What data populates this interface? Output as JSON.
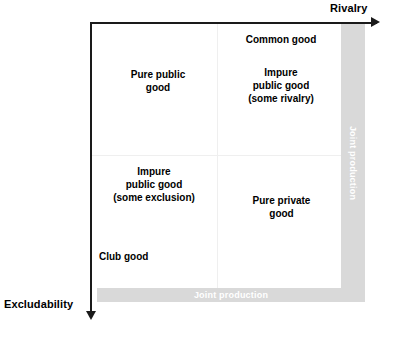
{
  "diagram": {
    "axes": {
      "horizontal": {
        "label": "Rivalry",
        "direction": "right"
      },
      "vertical": {
        "label": "Excludability",
        "direction": "down"
      }
    },
    "bands": {
      "right": {
        "label": "Joint production",
        "orientation": "vertical",
        "color": "#d9d9d9",
        "text_color": "#ffffff"
      },
      "bottom": {
        "label": "Joint production",
        "orientation": "horizontal",
        "color": "#d9d9d9",
        "text_color": "#ffffff"
      }
    },
    "quadrants": [
      {
        "id": "top-left",
        "labels": [
          {
            "id": "pure-public-good",
            "text": "Pure public\ngood",
            "align": "center"
          }
        ]
      },
      {
        "id": "top-right",
        "labels": [
          {
            "id": "common-good",
            "text": "Common good",
            "align": "center"
          },
          {
            "id": "impure-public-good-rivalry",
            "text": "Impure\npublic good\n(some rivalry)",
            "align": "center"
          }
        ]
      },
      {
        "id": "bottom-left",
        "labels": [
          {
            "id": "impure-public-good-exclusion",
            "text": "Impure\npublic good\n(some exclusion)",
            "align": "center"
          },
          {
            "id": "club-good",
            "text": "Club good",
            "align": "left"
          }
        ]
      },
      {
        "id": "bottom-right",
        "labels": [
          {
            "id": "pure-private-good",
            "text": "Pure private\ngood",
            "align": "center"
          }
        ]
      }
    ],
    "colors": {
      "axis": "#1a1a1a",
      "band": "#d9d9d9",
      "band_text": "#ffffff",
      "divider": "#efefef",
      "background": "#ffffff",
      "text": "#000000"
    }
  }
}
